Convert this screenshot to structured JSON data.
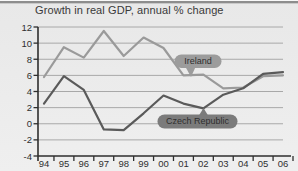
{
  "chart_data": {
    "type": "line",
    "title": "Growth in real GDP, annual % change",
    "categories": [
      "94",
      "95",
      "96",
      "97",
      "98",
      "99",
      "00",
      "01",
      "02",
      "03",
      "04",
      "05",
      "06"
    ],
    "series": [
      {
        "name": "Ireland",
        "values": [
          5.8,
          9.5,
          8.2,
          11.5,
          8.4,
          10.7,
          9.4,
          6.0,
          6.1,
          4.4,
          4.5,
          5.9,
          6.0
        ]
      },
      {
        "name": "Czech Republic",
        "values": [
          2.5,
          5.9,
          4.2,
          -0.7,
          -0.8,
          1.3,
          3.5,
          2.5,
          1.9,
          3.6,
          4.4,
          6.2,
          6.4
        ]
      }
    ],
    "xlabel": "",
    "ylabel": "",
    "ylim": [
      -4,
      12
    ],
    "ytick_step": 2,
    "y_tick_labels": [
      "12",
      "10",
      "8",
      "6",
      "4",
      "2",
      "0",
      "-2",
      "-4"
    ],
    "grid": true,
    "legend": "inline-bubble-callouts"
  },
  "colors": {
    "background": "#e9e9e9",
    "title_text": "#3a3a3a",
    "grid_line": "#a8a8a8",
    "axis_line": "#2e2e2e",
    "tick_label": "#2f2f2f",
    "ireland_line": "#9a9a9a",
    "czech_line": "#5a5a5a",
    "ireland_bubble_fill": "#9c9c9c",
    "czech_bubble_fill": "#7b7b7b",
    "bubble_text": "#ededed"
  }
}
